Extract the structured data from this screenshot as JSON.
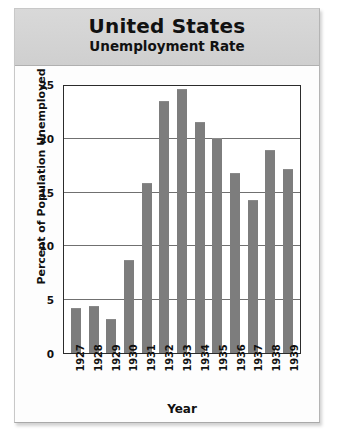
{
  "chart_data": {
    "type": "bar",
    "title": "United States",
    "subtitle": "Unemployment Rate",
    "xlabel": "Year",
    "ylabel": "Percent of Population Unemployed",
    "categories": [
      "1927",
      "1928",
      "1929",
      "1930",
      "1931",
      "1932",
      "1933",
      "1934",
      "1935",
      "1936",
      "1937",
      "1938",
      "1939"
    ],
    "values": [
      4.2,
      4.4,
      3.2,
      8.7,
      15.9,
      23.6,
      24.7,
      21.6,
      20.1,
      16.9,
      14.3,
      19.0,
      17.2
    ],
    "ylim": [
      0,
      25
    ],
    "ytick_values": [
      0,
      5,
      10,
      15,
      20,
      25
    ],
    "ytick_labels": [
      "0",
      "5",
      "10",
      "15",
      "20",
      "25"
    ],
    "grid": true,
    "legend": false,
    "bar_color": "#7d7d7d",
    "plot_background": "#ffffff",
    "title_band_color": "#d4d4d4",
    "axis_color": "#2b2b2b"
  }
}
